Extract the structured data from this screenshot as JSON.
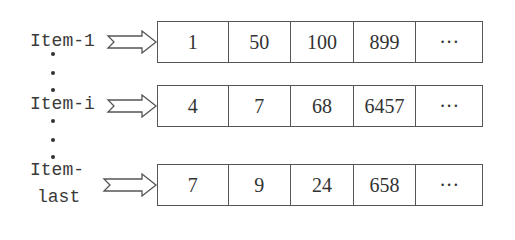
{
  "diagram": {
    "rows": [
      {
        "label_lines": [
          "Item-1"
        ],
        "cells": [
          "1",
          "50",
          "100",
          "899",
          "···"
        ]
      },
      {
        "label_lines": [
          "Item-i"
        ],
        "cells": [
          "4",
          "7",
          "68",
          "6457",
          "···"
        ]
      },
      {
        "label_lines": [
          "Item-",
          "last"
        ],
        "cells": [
          "7",
          "9",
          "24",
          "658",
          "···"
        ]
      }
    ],
    "ellipsis_marker": "vertical-dots",
    "arrow_icon": "notched-block-arrow-right"
  }
}
